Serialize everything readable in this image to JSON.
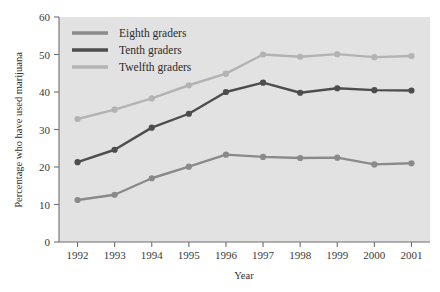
{
  "chart_data": {
    "type": "line",
    "title": "",
    "xlabel": "Year",
    "ylabel": "Percentage who have used marijuana",
    "categories": [
      "1992",
      "1993",
      "1994",
      "1995",
      "1996",
      "1997",
      "1998",
      "1999",
      "2000",
      "2001"
    ],
    "x": [
      1992,
      1993,
      1994,
      1995,
      1996,
      1997,
      1998,
      1999,
      2000,
      2001
    ],
    "xlim": [
      1991.5,
      2001.5
    ],
    "ylim": [
      0,
      60
    ],
    "yticks": [
      0,
      10,
      20,
      30,
      40,
      50,
      60
    ],
    "ytick_labels": [
      "0",
      "10",
      "20",
      "30",
      "40",
      "50",
      "60"
    ],
    "grid": false,
    "legend_position": "upper-left-inside",
    "series": [
      {
        "name": "Eighth graders",
        "color": "#8a8a8a",
        "values": [
          11.2,
          12.6,
          17.0,
          20.1,
          23.3,
          22.7,
          22.4,
          22.5,
          20.7,
          21.0
        ]
      },
      {
        "name": "Tenth graders",
        "color": "#4d4d4d",
        "values": [
          21.3,
          24.6,
          30.5,
          34.2,
          40.0,
          42.5,
          39.8,
          41.0,
          40.5,
          40.4
        ]
      },
      {
        "name": "Twelfth graders",
        "color": "#b3b3b3",
        "values": [
          32.8,
          35.3,
          38.3,
          41.8,
          44.9,
          50.0,
          49.4,
          50.1,
          49.3,
          49.6
        ]
      }
    ]
  },
  "legend": {
    "items": [
      {
        "label": "Eighth graders"
      },
      {
        "label": "Tenth graders"
      },
      {
        "label": "Twelfth graders"
      }
    ]
  },
  "colors": {
    "plot_background": "#e2e2e2",
    "page_background": "#ffffff",
    "axis": "#6f6f6f",
    "text": "#2b2b2b"
  }
}
